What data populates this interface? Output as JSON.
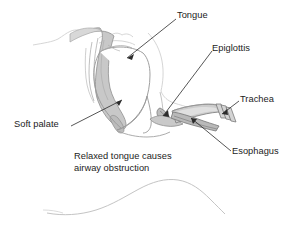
{
  "figure": {
    "background_color": "#ffffff",
    "outline_color": "#8c8c8c",
    "faint_outline_color": "#c9c9c9",
    "tissue_fill_color": "#c6c6c6",
    "tissue_fill_light": "#d9d9d9",
    "tissue_fill_dark": "#b0b0b0",
    "leader_color": "#2b2b2b",
    "text_color": "#1c1c1c"
  },
  "labels": {
    "tongue": "Tongue",
    "epiglottis": "Epiglottis",
    "trachea": "Trachea",
    "esophagus": "Esophagus",
    "soft_palate": "Soft palate",
    "caption_line1": "Relaxed tongue causes",
    "caption_line2": "airway obstruction"
  },
  "structures": [
    {
      "name": "soft-palate",
      "label": "Soft palate"
    },
    {
      "name": "tongue",
      "label": "Tongue"
    },
    {
      "name": "epiglottis",
      "label": "Epiglottis"
    },
    {
      "name": "trachea",
      "label": "Trachea"
    },
    {
      "name": "esophagus",
      "label": "Esophagus"
    }
  ]
}
